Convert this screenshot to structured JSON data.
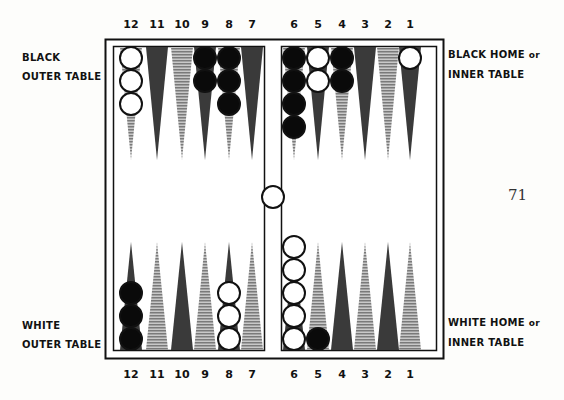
{
  "point_numbers": {
    "top": [
      "12",
      "11",
      "10",
      "9",
      "8",
      "7",
      "6",
      "5",
      "4",
      "3",
      "2",
      "1"
    ],
    "bottom": [
      "12",
      "11",
      "10",
      "9",
      "8",
      "7",
      "6",
      "5",
      "4",
      "3",
      "2",
      "1"
    ]
  },
  "labels": {
    "black_outer": [
      "BLACK",
      "OUTER TABLE"
    ],
    "black_home": {
      "line1": "BLACK HOME",
      "or": "or",
      "line2": "INNER TABLE"
    },
    "white_outer": [
      "WHITE",
      "OUTER TABLE"
    ],
    "white_home": {
      "line1": "WHITE HOME",
      "or": "or",
      "line2": "INNER TABLE"
    }
  },
  "page_number": "71",
  "board": {
    "colors": {
      "dark": "#3a3a3a",
      "stripe": "#9a9a9a",
      "black_checker": "#0a0a0a",
      "white_checker": "#ffffff"
    },
    "top_points": [
      {
        "point": "12",
        "style": "stripe",
        "checkers": {
          "color": "white",
          "count": 3
        }
      },
      {
        "point": "11",
        "style": "dark",
        "checkers": null
      },
      {
        "point": "10",
        "style": "stripe",
        "checkers": null
      },
      {
        "point": "9",
        "style": "dark",
        "checkers": {
          "color": "black",
          "count": 2
        }
      },
      {
        "point": "8",
        "style": "stripe",
        "checkers": {
          "color": "black",
          "count": 3
        }
      },
      {
        "point": "7",
        "style": "dark",
        "checkers": null
      },
      {
        "point": "6",
        "style": "stripe",
        "checkers": {
          "color": "black",
          "count": 4
        }
      },
      {
        "point": "5",
        "style": "dark",
        "checkers": {
          "color": "white",
          "count": 2
        }
      },
      {
        "point": "4",
        "style": "stripe",
        "checkers": {
          "color": "black",
          "count": 2
        }
      },
      {
        "point": "3",
        "style": "dark",
        "checkers": null
      },
      {
        "point": "2",
        "style": "stripe",
        "checkers": null
      },
      {
        "point": "1",
        "style": "dark",
        "checkers": {
          "color": "white",
          "count": 1
        }
      }
    ],
    "bottom_points": [
      {
        "point": "12",
        "style": "dark",
        "checkers": {
          "color": "black",
          "count": 3
        }
      },
      {
        "point": "11",
        "style": "stripe",
        "checkers": null
      },
      {
        "point": "10",
        "style": "dark",
        "checkers": null
      },
      {
        "point": "9",
        "style": "stripe",
        "checkers": null
      },
      {
        "point": "8",
        "style": "dark",
        "checkers": {
          "color": "white",
          "count": 3
        }
      },
      {
        "point": "7",
        "style": "stripe",
        "checkers": null
      },
      {
        "point": "6",
        "style": "dark",
        "checkers": {
          "color": "white",
          "count": 5
        }
      },
      {
        "point": "5",
        "style": "stripe",
        "checkers": {
          "color": "black",
          "count": 1
        }
      },
      {
        "point": "4",
        "style": "dark",
        "checkers": null
      },
      {
        "point": "3",
        "style": "stripe",
        "checkers": null
      },
      {
        "point": "2",
        "style": "dark",
        "checkers": null
      },
      {
        "point": "1",
        "style": "stripe",
        "checkers": null
      }
    ],
    "bar": {
      "checkers": {
        "color": "white",
        "count": 1
      }
    }
  }
}
